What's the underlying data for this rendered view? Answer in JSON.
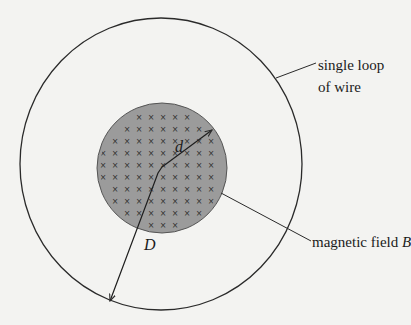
{
  "diagram": {
    "colors": {
      "background": "#f3f3f1",
      "line": "#2a2a2a",
      "field_fill": "#9b9b9b",
      "field_mark": "#2f2f2f"
    },
    "outer_loop": {
      "cx": 161,
      "cy": 164,
      "rx": 141,
      "ry": 146
    },
    "field_region": {
      "cx": 162,
      "cy": 168,
      "r": 65
    },
    "field_marks": {
      "symbol": "×",
      "spacing": 12,
      "origin_x": 103,
      "origin_y": 105
    },
    "labels": {
      "loop_line1": "single loop",
      "loop_line2": "of wire",
      "field": "magnetic field ",
      "field_symbol": "B",
      "inner_radius": "d",
      "outer_radius": "D"
    }
  }
}
